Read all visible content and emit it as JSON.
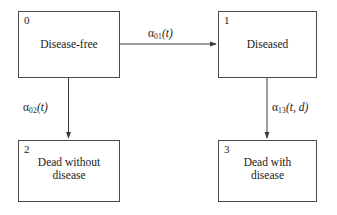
{
  "diagram": {
    "type": "state-transition-diagram",
    "title": "",
    "states": [
      {
        "id": "0",
        "name": "disease-free",
        "label": "Disease-free"
      },
      {
        "id": "1",
        "name": "diseased",
        "label": "Diseased"
      },
      {
        "id": "2",
        "name": "dead-without-disease",
        "label": "Dead without\ndisease"
      },
      {
        "id": "3",
        "name": "dead-with-disease",
        "label": "Dead with\ndisease"
      }
    ],
    "transitions": [
      {
        "name": "alpha-01",
        "from": "0",
        "to": "1",
        "direction": "horizontal",
        "symbol": "α",
        "subscript": "01",
        "args": "(t)",
        "label": "α01(t)"
      },
      {
        "name": "alpha-02",
        "from": "0",
        "to": "2",
        "direction": "vertical",
        "symbol": "α",
        "subscript": "02",
        "args": "(t)",
        "label": "α02(t)"
      },
      {
        "name": "alpha-13",
        "from": "1",
        "to": "3",
        "direction": "vertical",
        "symbol": "α",
        "subscript": "13",
        "args": "(t, d)",
        "label": "α13(t, d)"
      }
    ],
    "colors": {
      "background": "#ffffff",
      "box_border": "#4a4a4a",
      "text": "#1a1a1a",
      "arrow": "#3a3a3a"
    }
  }
}
